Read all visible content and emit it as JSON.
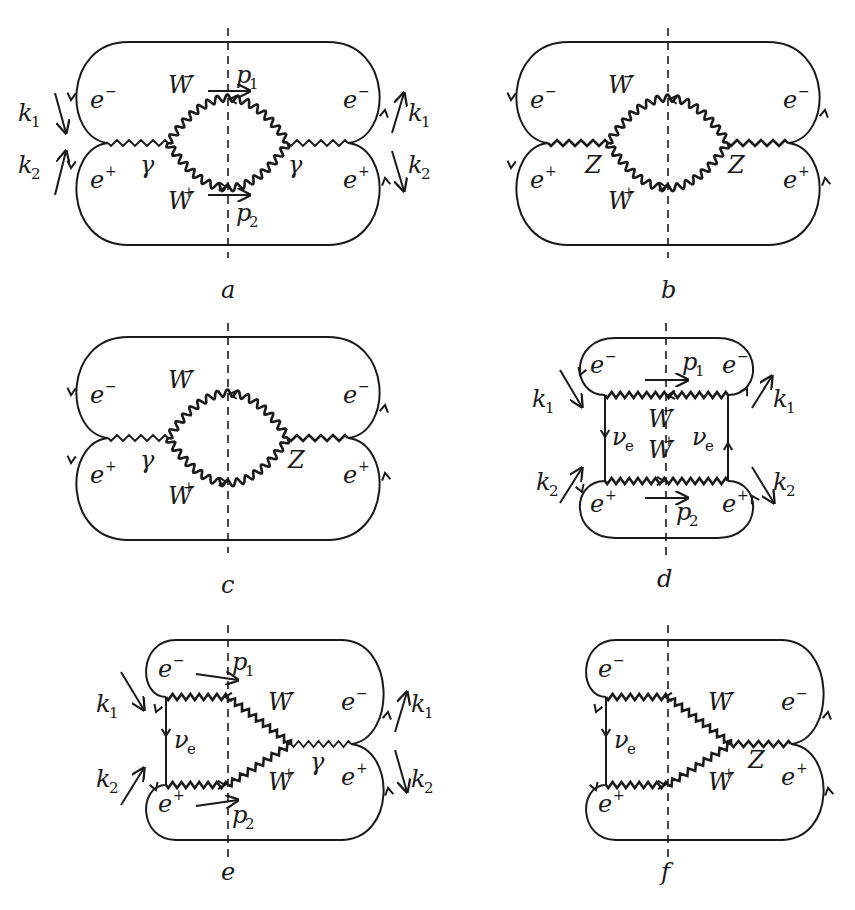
{
  "figure": {
    "panels": [
      {
        "id": "a",
        "caption": "a",
        "exchange_left": "γ",
        "exchange_right": "γ",
        "labels": {
          "em_left": "e",
          "em_left_sup": "−",
          "ep_left": "e",
          "ep_left_sup": "+",
          "em_right": "e",
          "em_right_sup": "−",
          "ep_right": "e",
          "ep_right_sup": "+",
          "wm": "W",
          "wm_sup": "−",
          "wp": "W",
          "wp_sup": "+",
          "p1": "p",
          "p1_sub": "1",
          "p2": "p",
          "p2_sub": "2",
          "k1": "k",
          "k1_sub": "1",
          "k2": "k",
          "k2_sub": "2"
        }
      },
      {
        "id": "b",
        "caption": "b",
        "exchange_left": "Z",
        "exchange_right": "Z",
        "labels": {
          "em_left": "e",
          "em_left_sup": "−",
          "ep_left": "e",
          "ep_left_sup": "+",
          "em_right": "e",
          "em_right_sup": "−",
          "ep_right": "e",
          "ep_right_sup": "+",
          "wm": "W",
          "wm_sup": "−",
          "wp": "W",
          "wp_sup": "+"
        }
      },
      {
        "id": "c",
        "caption": "c",
        "exchange_left": "γ",
        "exchange_right": "Z",
        "labels": {
          "em_left": "e",
          "em_left_sup": "−",
          "ep_left": "e",
          "ep_left_sup": "+",
          "em_right": "e",
          "em_right_sup": "−",
          "ep_right": "e",
          "ep_right_sup": "+",
          "wm": "W",
          "wm_sup": "−",
          "wp": "W",
          "wp_sup": "+"
        }
      },
      {
        "id": "d",
        "caption": "d",
        "labels": {
          "em_left": "e",
          "em_left_sup": "−",
          "ep_left": "e",
          "ep_left_sup": "+",
          "em_right": "e",
          "em_right_sup": "−",
          "ep_right": "e",
          "ep_right_sup": "+",
          "wm": "W",
          "wm_sup": "−",
          "wp": "W",
          "wp_sup": "+",
          "nu_left": "ν",
          "nu_left_sub": "e",
          "nu_right": "ν",
          "nu_right_sub": "e",
          "p1": "p",
          "p1_sub": "1",
          "p2": "p",
          "p2_sub": "2",
          "k1_left": "k",
          "k1_left_sub": "1",
          "k2_left": "k",
          "k2_left_sub": "2",
          "k1_right": "k",
          "k1_right_sub": "1",
          "k2_right": "k",
          "k2_right_sub": "2"
        }
      },
      {
        "id": "e",
        "caption": "e",
        "exchange_right": "γ",
        "labels": {
          "em_left": "e",
          "em_left_sup": "−",
          "ep_left": "e",
          "ep_left_sup": "+",
          "em_right": "e",
          "em_right_sup": "−",
          "ep_right": "e",
          "ep_right_sup": "+",
          "wm": "W",
          "wm_sup": "−",
          "wp": "W",
          "wp_sup": "+",
          "nu": "ν",
          "nu_sub": "e",
          "p1": "p",
          "p1_sub": "1",
          "p2": "p",
          "p2_sub": "2",
          "k1_left": "k",
          "k1_left_sub": "1",
          "k2_left": "k",
          "k2_left_sub": "2",
          "k1_right": "k",
          "k1_right_sub": "1",
          "k2_right": "k",
          "k2_right_sub": "2"
        }
      },
      {
        "id": "f",
        "caption": "f",
        "exchange_right": "Z",
        "labels": {
          "em_left": "e",
          "em_left_sup": "−",
          "ep_left": "e",
          "ep_left_sup": "+",
          "em_right": "e",
          "em_right_sup": "−",
          "ep_right": "e",
          "ep_right_sup": "+",
          "wm": "W",
          "wm_sup": "−",
          "wp": "W",
          "wp_sup": "+",
          "nu": "ν",
          "nu_sub": "e"
        }
      }
    ]
  }
}
